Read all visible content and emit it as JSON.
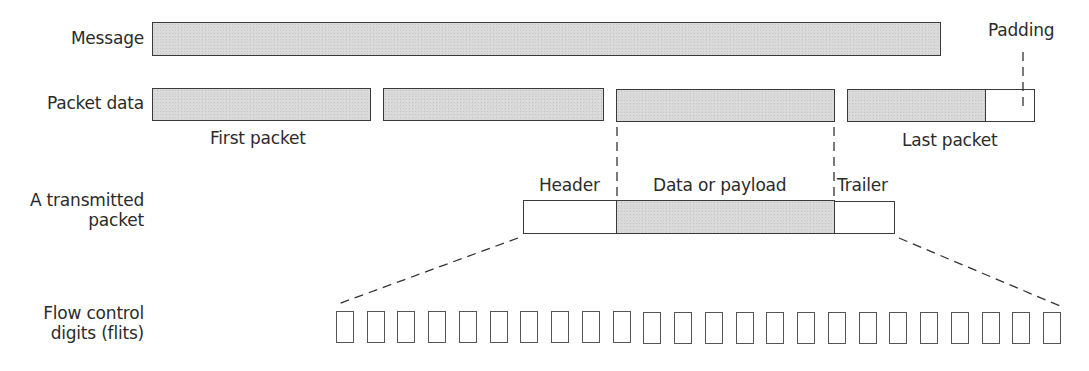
{
  "diagram": {
    "type": "packet-structure",
    "row_labels": {
      "message": "Message",
      "packet_data": "Packet data",
      "transmitted_packet_line1": "A transmitted",
      "transmitted_packet_line2": "packet",
      "flits_line1": "Flow control",
      "flits_line2": "digits (flits)"
    },
    "annotations": {
      "padding": "Padding",
      "first_packet": "First packet",
      "last_packet": "Last packet",
      "header": "Header",
      "data_or_payload": "Data or payload",
      "trailer": "Trailer"
    },
    "packets": [
      {
        "name": "first-packet",
        "shaded": true
      },
      {
        "name": "packet-2",
        "shaded": true
      },
      {
        "name": "packet-3",
        "shaded": true,
        "expanded": true
      },
      {
        "name": "last-packet",
        "shaded": true,
        "has_padding": true
      }
    ],
    "transmitted_packet_segments": [
      {
        "name": "header",
        "shaded": false
      },
      {
        "name": "payload",
        "shaded": true
      },
      {
        "name": "trailer",
        "shaded": false
      }
    ],
    "flit_count": 24,
    "colors": {
      "shaded_fill": "#d8d8d8",
      "outline": "#3a3a3a",
      "text": "#2b2b2b",
      "background": "#ffffff"
    }
  }
}
